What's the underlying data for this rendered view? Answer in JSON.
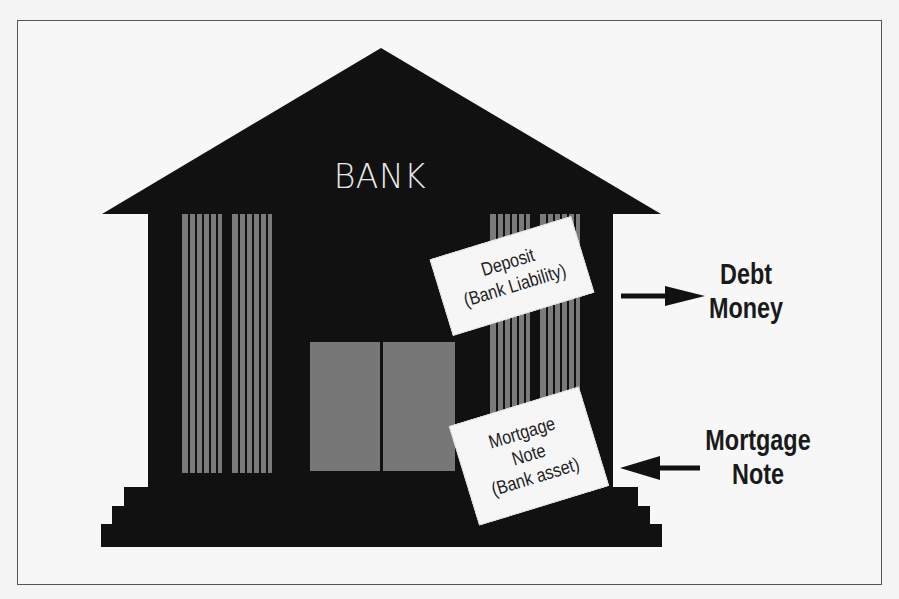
{
  "diagram": {
    "building_label": "BANK",
    "cards": {
      "deposit": {
        "line1": "Deposit",
        "line2": "(Bank Liability)"
      },
      "mortgage": {
        "line1": "Mortgage",
        "line2": "Note",
        "line3": "(Bank asset)"
      }
    },
    "outputs": {
      "debt_money": {
        "line1": "Debt",
        "line2": "Money",
        "arrow": "right"
      },
      "mortgage_note": {
        "line1": "Mortgage",
        "line2": "Note",
        "arrow": "left"
      }
    },
    "colors": {
      "building": "#111111",
      "columns": "#7a7a7a",
      "door": "#777777",
      "card": "#f6f6f6",
      "background": "#f7f7f7"
    }
  }
}
